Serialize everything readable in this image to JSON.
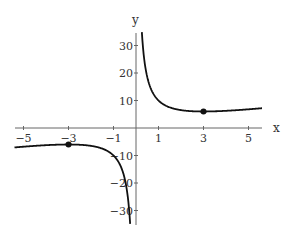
{
  "chart_data": {
    "type": "line",
    "title": "",
    "function": "y = x + 9/x",
    "xlabel": "x",
    "ylabel": "y",
    "xlim": [
      -5.4,
      5.6
    ],
    "ylim": [
      -35,
      35
    ],
    "grid": false,
    "x_ticks": [
      -5,
      -3,
      -1,
      1,
      3,
      5
    ],
    "x_tick_labels": [
      "-5",
      "-3",
      "-1",
      "1",
      "3",
      "5"
    ],
    "y_ticks": [
      30,
      20,
      10,
      -10,
      -20,
      -30
    ],
    "y_tick_labels": [
      "30",
      "20",
      "10",
      "-10",
      "-20",
      "-30"
    ],
    "series": [
      {
        "name": "right branch",
        "x": [
          0.26,
          0.3,
          0.4,
          0.5,
          0.75,
          1,
          1.5,
          2,
          2.5,
          3,
          3.5,
          4,
          4.5,
          5,
          5.6
        ],
        "y": [
          34.88,
          30.3,
          22.9,
          18.5,
          12.75,
          10,
          7.5,
          6.5,
          6.1,
          6,
          6.07,
          6.25,
          6.5,
          6.8,
          7.21
        ]
      },
      {
        "name": "left branch",
        "x": [
          -5.4,
          -5,
          -4.5,
          -4,
          -3.5,
          -3,
          -2.5,
          -2,
          -1.5,
          -1,
          -0.75,
          -0.5,
          -0.4,
          -0.3,
          -0.26
        ],
        "y": [
          -7.07,
          -6.8,
          -6.5,
          -6.25,
          -6.07,
          -6,
          -6.1,
          -6.5,
          -7.5,
          -10,
          -12.75,
          -18.5,
          -22.9,
          -30.3,
          -34.88
        ]
      }
    ],
    "points": [
      {
        "label": "local minimum",
        "x": 3,
        "y": 6
      },
      {
        "label": "local maximum",
        "x": -3,
        "y": -6
      }
    ],
    "colors": {
      "curve": "#111111",
      "axis": "#555555",
      "point": "#111111"
    }
  }
}
